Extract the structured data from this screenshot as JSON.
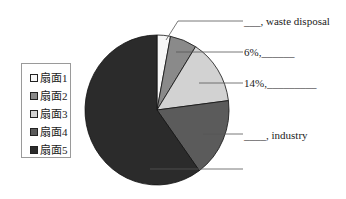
{
  "chart_data": {
    "type": "pie",
    "title": "",
    "categories": [
      "扇面1",
      "扇面2",
      "扇面3",
      "扇面4",
      "扇面5"
    ],
    "values": [
      3,
      6,
      14,
      17,
      60
    ],
    "colors": [
      "#f7f7f7",
      "#8a8a8a",
      "#d2d2d2",
      "#5b5b5b",
      "#2b2b2b"
    ],
    "start_angle_deg_clockwise_from_top": 0,
    "legend_position": "left",
    "annotations": [
      {
        "slice": "扇面1",
        "text": "___, waste disposal"
      },
      {
        "slice": "扇面2",
        "text": "6%, ______"
      },
      {
        "slice": "扇面3",
        "text": "14%, _________"
      },
      {
        "slice": "扇面4",
        "text": "____, industry"
      },
      {
        "slice": "扇面5",
        "text": ""
      }
    ]
  },
  "legend": {
    "items": [
      {
        "label": "扇面1",
        "color": "#f7f7f7"
      },
      {
        "label": "扇面2",
        "color": "#8a8a8a"
      },
      {
        "label": "扇面3",
        "color": "#d2d2d2"
      },
      {
        "label": "扇面4",
        "color": "#5b5b5b"
      },
      {
        "label": "扇面5",
        "color": "#2b2b2b"
      }
    ]
  },
  "labels": {
    "slice1_blank": "___",
    "slice1_text": ", waste disposal",
    "slice2_pct": "6%,",
    "slice2_blank": "______",
    "slice3_pct": "14%,",
    "slice3_blank": "_________",
    "slice4_blank": "____",
    "slice4_text": ", industry"
  }
}
